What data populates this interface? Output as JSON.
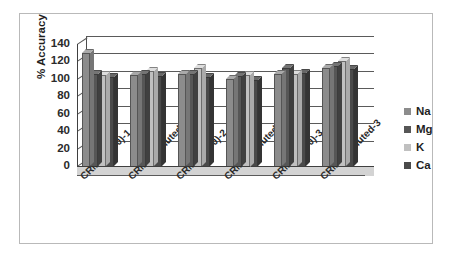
{
  "chart_data": {
    "type": "bar",
    "title": "",
    "xlabel": "",
    "ylabel": "% Accuracy",
    "ylim": [
      0,
      140
    ],
    "ytick_step": 20,
    "yticks": [
      0,
      20,
      40,
      60,
      80,
      100,
      120,
      140
    ],
    "ytick_labels": [
      "0",
      "20",
      "40",
      "60",
      "80",
      "100",
      "120",
      "140"
    ],
    "grid": true,
    "legend_position": "right",
    "style": "3d-clustered-column",
    "categories": [
      "CRM(1+100)-1",
      "CRM Undiluted-1",
      "CRM(1+100)-2",
      "CRM Undiluted-2",
      "CRM(1+100)-3",
      "CRM Undiluted-3"
    ],
    "series": [
      {
        "name": "Na",
        "color": "#8c8c8c",
        "values": [
          130,
          104,
          106,
          100,
          106,
          113
        ]
      },
      {
        "name": "Mg",
        "color": "#565656",
        "values": [
          106,
          106,
          106,
          103,
          113,
          115
        ]
      },
      {
        "name": "K",
        "color": "#c0c0c0",
        "values": [
          104,
          109,
          112,
          105,
          106,
          120
        ]
      },
      {
        "name": "Ca",
        "color": "#4a4a4a",
        "values": [
          102,
          103,
          102,
          99,
          107,
          111
        ]
      }
    ]
  },
  "legend": {
    "items": [
      {
        "label": "Na",
        "color": "#8c8c8c"
      },
      {
        "label": "Mg",
        "color": "#565656"
      },
      {
        "label": "K",
        "color": "#c0c0c0"
      },
      {
        "label": "Ca",
        "color": "#4a4a4a"
      }
    ]
  }
}
